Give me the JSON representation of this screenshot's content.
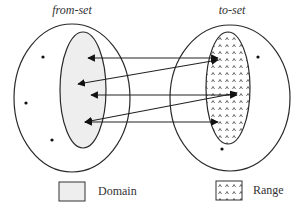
{
  "labels": {
    "from_set": "from-set",
    "to_set": "to-set"
  },
  "legend": [
    {
      "label": "Domain",
      "swatch": "solid-light-gray"
    },
    {
      "label": "Range",
      "swatch": "caret-pattern"
    }
  ],
  "colors": {
    "stroke": "#2a2a2a",
    "domain_fill": "#eeeeee",
    "range_fill": "#ffffff",
    "pattern_mark": "#444444",
    "background": "#ffffff"
  },
  "sets": {
    "from_set": {
      "outer": {
        "cx": 72,
        "cy": 98,
        "rx": 58,
        "ry": 74
      },
      "domain": {
        "cx": 83,
        "cy": 90,
        "rx": 23,
        "ry": 58
      },
      "unmapped_points": [
        {
          "x": 43,
          "y": 57
        },
        {
          "x": 26,
          "y": 103
        },
        {
          "x": 52,
          "y": 140
        }
      ]
    },
    "to_set": {
      "outer": {
        "cx": 230,
        "cy": 98,
        "rx": 60,
        "ry": 73
      },
      "range": {
        "cx": 228,
        "cy": 88,
        "rx": 22,
        "ry": 56
      },
      "unmapped_points": [
        {
          "x": 258,
          "y": 57
        },
        {
          "x": 222,
          "y": 149
        }
      ]
    }
  },
  "mappings": [
    {
      "x1": 88,
      "y1": 58,
      "x2": 218,
      "y2": 58
    },
    {
      "x1": 78,
      "y1": 84,
      "x2": 218,
      "y2": 60
    },
    {
      "x1": 91,
      "y1": 95,
      "x2": 237,
      "y2": 95
    },
    {
      "x1": 85,
      "y1": 122,
      "x2": 237,
      "y2": 93
    },
    {
      "x1": 85,
      "y1": 122,
      "x2": 218,
      "y2": 122
    }
  ]
}
